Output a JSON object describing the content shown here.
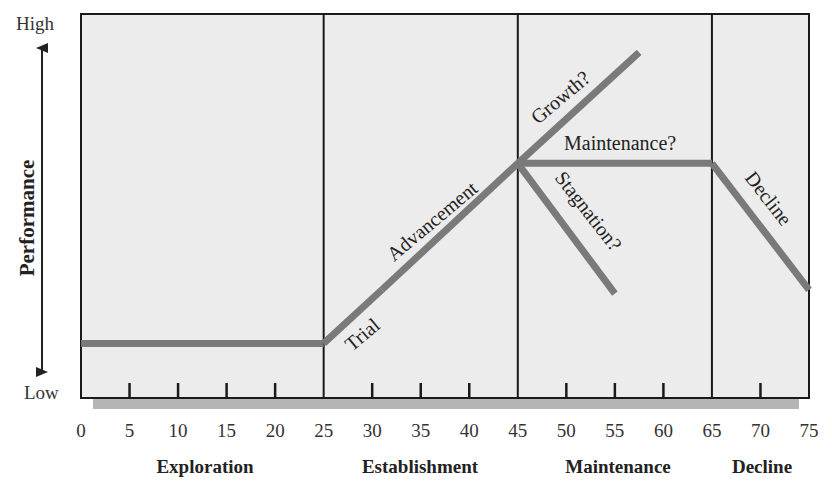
{
  "chart_data": {
    "type": "line",
    "title": "",
    "xlabel": "",
    "ylabel": "Performance",
    "y_axis_ends": {
      "high": "High",
      "low": "Low"
    },
    "xlim": [
      0,
      75
    ],
    "x_ticks": [
      0,
      5,
      10,
      15,
      20,
      25,
      30,
      35,
      40,
      45,
      50,
      55,
      60,
      65,
      70,
      75
    ],
    "x_tick_labels": [
      "0",
      "5",
      "10",
      "15",
      "20",
      "25",
      "30",
      "35",
      "40",
      "45",
      "50",
      "55",
      "60",
      "65",
      "70",
      "75"
    ],
    "stage_boundaries": [
      25,
      45,
      65
    ],
    "stages": [
      {
        "label": "Exploration",
        "from": 0,
        "to": 25
      },
      {
        "label": "Establishment",
        "from": 25,
        "to": 45
      },
      {
        "label": "Maintenance",
        "from": 45,
        "to": 65
      },
      {
        "label": "Decline",
        "from": 65,
        "to": 75
      }
    ],
    "ylim": [
      0,
      100
    ],
    "grid": false,
    "series": [
      {
        "name": "Exploration (flat)",
        "x": [
          0,
          25
        ],
        "y": [
          14,
          14
        ]
      },
      {
        "name": "Trial",
        "x": [
          25,
          31
        ],
        "y": [
          14,
          28
        ]
      },
      {
        "name": "Advancement",
        "x": [
          31,
          45
        ],
        "y": [
          28,
          61
        ]
      },
      {
        "name": "Growth?",
        "x": [
          45,
          57.5
        ],
        "y": [
          61,
          90
        ]
      },
      {
        "name": "Maintenance?",
        "x": [
          45,
          65
        ],
        "y": [
          61,
          61
        ]
      },
      {
        "name": "Stagnation?",
        "x": [
          45,
          55
        ],
        "y": [
          61,
          27
        ]
      },
      {
        "name": "Decline",
        "x": [
          65,
          75
        ],
        "y": [
          61,
          28
        ]
      }
    ],
    "annotations": [
      "Trial",
      "Advancement",
      "Growth?",
      "Maintenance?",
      "Stagnation?",
      "Decline"
    ],
    "colors": {
      "background": "#ececec",
      "line": "#7a7a7a",
      "frame": "#1a1a1a",
      "shadow": "#b5b5b5"
    }
  },
  "labels": {
    "high": "High",
    "low": "Low",
    "performance": "Performance",
    "trial": "Trial",
    "advancement": "Advancement",
    "growth": "Growth?",
    "maintenance_q": "Maintenance?",
    "stagnation": "Stagnation?",
    "decline_line": "Decline",
    "stage_exploration": "Exploration",
    "stage_establishment": "Establishment",
    "stage_maintenance": "Maintenance",
    "stage_decline": "Decline"
  }
}
